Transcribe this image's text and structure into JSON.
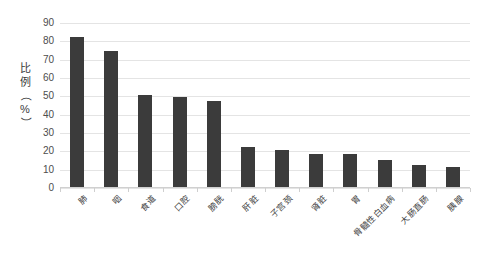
{
  "chart_data": {
    "type": "bar",
    "title": "",
    "subtitle": "",
    "xlabel": "",
    "ylabel": "比例（%）",
    "ylim": [
      0,
      90
    ],
    "ytick_step": 10,
    "yticks": [
      90,
      80,
      70,
      60,
      50,
      40,
      30,
      20,
      10,
      0
    ],
    "grid": true,
    "legend": false,
    "bar_color": "#3b3b3b",
    "gridline_color": "#e4e4e4",
    "categories": [
      "肺",
      "咽",
      "食道",
      "口腔",
      "膀胱",
      "肝脏",
      "子宫颈",
      "肾脏",
      "胃",
      "骨髓性白血病",
      "大肠直肠",
      "胰腺"
    ],
    "values": [
      82,
      74,
      50,
      49,
      47,
      22,
      20,
      18,
      18,
      15,
      12,
      11
    ]
  },
  "axis": {
    "y_title_chars": [
      "比",
      "例",
      "（",
      "%",
      "）"
    ]
  }
}
